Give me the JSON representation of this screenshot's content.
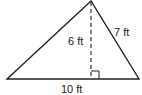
{
  "diagram": {
    "type": "triangle",
    "labels": {
      "height": "6 ft",
      "side": "7 ft",
      "base": "10 ft"
    },
    "colors": {
      "stroke": "#222222",
      "background": "#ffffff"
    }
  }
}
